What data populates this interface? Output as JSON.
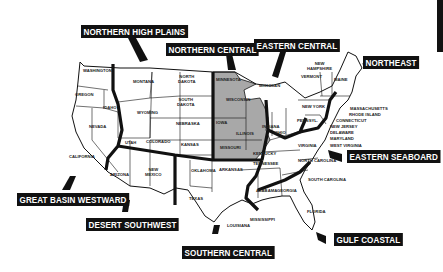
{
  "map": {
    "title": "US Regions Map",
    "colors": {
      "highlight_fill": "#a8a8a8",
      "boundary": "#111111",
      "label_bg": "#111111",
      "label_text": "#ffffff"
    },
    "regions": [
      {
        "id": "northern_high_plains",
        "label": "NORTHERN HIGH PLAINS"
      },
      {
        "id": "northern_central",
        "label": "NORTHERN CENTRAL"
      },
      {
        "id": "eastern_central",
        "label": "EASTERN CENTRAL"
      },
      {
        "id": "northeast",
        "label": "NORTHEAST"
      },
      {
        "id": "eastern_seaboard",
        "label": "EASTERN SEABOARD"
      },
      {
        "id": "gulf_coastal",
        "label": "GULF COASTAL"
      },
      {
        "id": "southern_central",
        "label": "SOUTHERN CENTRAL"
      },
      {
        "id": "desert_southwest",
        "label": "DESERT SOUTHWEST"
      },
      {
        "id": "great_basin_westward",
        "label": "GREAT BASIN WESTWARD"
      }
    ],
    "states": {
      "washington": "WASHINGTON",
      "oregon": "OREGON",
      "idaho": "IDAHO",
      "nevada": "NEVADA",
      "california": "CALIFORNIA",
      "montana": "MONTANA",
      "wyoming": "WYOMING",
      "utah": "UTAH",
      "colorado": "COLORADO",
      "arizona": "ARIZONA",
      "new_mexico_1": "NEW",
      "new_mexico_2": "MEXICO",
      "north_dakota_1": "NORTH",
      "north_dakota_2": "DAKOTA",
      "south_dakota_1": "SOUTH",
      "south_dakota_2": "DAKOTA",
      "nebraska": "NEBRASKA",
      "kansas": "KANSAS",
      "oklahoma": "OKLAHOMA",
      "texas": "TEXAS",
      "minnesota": "MINNESOTA",
      "iowa": "IOWA",
      "missouri": "MISSOURI",
      "wisconsin": "WISCONSIN",
      "illinois": "ILLINOIS",
      "arkansas": "ARKANSAS",
      "louisiana": "LOUISIANA",
      "mississippi": "MISSISSIPPI",
      "michigan": "MICHIGAN",
      "indiana": "INDIANA",
      "ohio": "OHIO",
      "kentucky": "KENTUCKY",
      "tennessee": "TENNESSEE",
      "alabama": "ALABAMA",
      "georgia": "GEORGIA",
      "florida": "FLORIDA",
      "south_carolina": "SOUTH CAROLINA",
      "north_carolina": "NORTH CAROLINA",
      "virginia": "VIRGINIA",
      "west_virginia": "WEST VIRGINIA",
      "maryland": "MARYLAND",
      "delaware": "DELAWARE",
      "new_jersey": "NEW JERSEY",
      "connecticut": "CONNECTICUT",
      "rhode_island": "RHODE ISLAND",
      "massachusetts": "MASSACHUSETTS",
      "pennsylvania": "PENNSYL.",
      "new_york": "NEW YORK",
      "vermont": "VERMONT",
      "new_hampshire_1": "NEW",
      "new_hampshire_2": "HAMPSHIRE",
      "maine": "MAINE"
    }
  }
}
